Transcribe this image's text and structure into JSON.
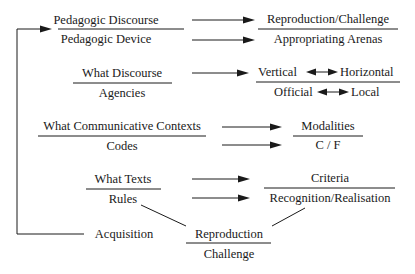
{
  "diagram": {
    "feedback_loop": {
      "source": "Acquisition",
      "target": "Pedagogic Discourse / Pedagogic Device"
    },
    "rows": [
      {
        "left": {
          "top": "Pedagogic Discourse",
          "bottom": "Pedagogic Device"
        },
        "right": {
          "top": "Reproduction/Challenge",
          "bottom": "Appropriating Arenas"
        }
      },
      {
        "left": {
          "top": "What Discourse",
          "bottom": "Agencies"
        },
        "right": {
          "top_left": "Vertical",
          "top_right": "Horizontal",
          "bottom_left": "Official",
          "bottom_right": "Local"
        }
      },
      {
        "left": {
          "top": "What Communicative Contexts",
          "bottom": "Codes"
        },
        "right": {
          "top": "Modalities",
          "bottom": "C / F"
        }
      },
      {
        "left": {
          "top": "What Texts",
          "bottom": "Rules"
        },
        "right": {
          "top": "Criteria",
          "bottom": "Recognition/Realisation"
        }
      }
    ],
    "acquisition": "Acquisition",
    "outcome": {
      "top": "Reproduction",
      "bottom": "Challenge"
    }
  },
  "colors": {
    "ink": "#1a1a1a",
    "background": "#ffffff"
  }
}
